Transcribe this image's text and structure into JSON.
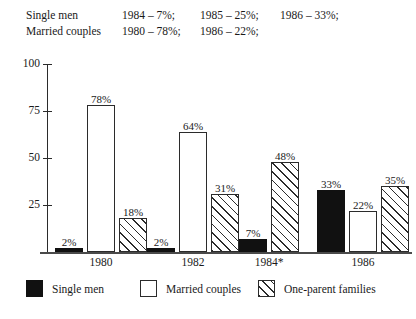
{
  "header_note": {
    "rows": [
      {
        "label": "Single men",
        "items": [
          "1984 – 7%;",
          "1985 – 25%;",
          "1986 – 33%;"
        ]
      },
      {
        "label": "Married couples",
        "items": [
          "1980 – 78%;",
          "1986 – 22%;",
          ""
        ]
      }
    ]
  },
  "legend": {
    "entries": [
      {
        "label": "Single men",
        "style": "solid",
        "color": "#111111"
      },
      {
        "label": "Married couples",
        "style": "open",
        "color": "#ffffff"
      },
      {
        "label": "One-parent families",
        "style": "hatch",
        "color": "#ffffff"
      }
    ]
  },
  "axis": {
    "y_ticks": [
      "100",
      "75",
      "50",
      "25"
    ],
    "y_values": [
      100,
      75,
      50,
      25
    ]
  },
  "chart_data": {
    "type": "bar",
    "title": "",
    "xlabel": "",
    "ylabel": "",
    "ylim": [
      0,
      100
    ],
    "grid": false,
    "legend_position": "bottom",
    "categories": [
      "1980",
      "1982",
      "1984*",
      "1986"
    ],
    "series": [
      {
        "name": "Single men",
        "style": "solid",
        "values": [
          2,
          2,
          7,
          33
        ]
      },
      {
        "name": "Married couples",
        "style": "open",
        "values": [
          78,
          64,
          null,
          22
        ]
      },
      {
        "name": "One-parent families",
        "style": "hatch",
        "values": [
          18,
          31,
          48,
          35
        ]
      }
    ],
    "bar_labels": [
      [
        "2%",
        "78%",
        "18%"
      ],
      [
        "2%",
        "64%",
        "31%"
      ],
      [
        "7%",
        null,
        "48%"
      ],
      [
        "33%",
        "22%",
        "35%"
      ]
    ],
    "annotations": [
      "* 1984 group has no Married couples bar"
    ]
  }
}
